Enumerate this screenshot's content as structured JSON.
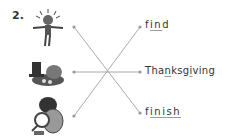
{
  "exercise": {
    "number": "2.",
    "instruction_type": "matching",
    "pictures": [
      {
        "name": "child-jumping-picture",
        "description": "child jumping with arms spread"
      },
      {
        "name": "turkey-dinner-picture",
        "description": "pilgrim hat and turkey dinner"
      },
      {
        "name": "detective-picture",
        "description": "detective with magnifying glass"
      }
    ],
    "words": [
      {
        "parts": [
          "f",
          "i",
          "n",
          "d"
        ],
        "underlined": [
          1,
          2
        ],
        "text": "find"
      },
      {
        "parts": [
          "Tha",
          "n",
          "ksg",
          "i",
          "ving"
        ],
        "underlined": [
          1,
          3
        ],
        "text": "Thanksgiving"
      },
      {
        "parts": [
          "f",
          "i",
          "n",
          "i",
          "s",
          "h"
        ],
        "underlined": [
          1,
          2,
          3,
          4,
          5
        ],
        "text": "finish"
      }
    ],
    "matches": [
      [
        0,
        2
      ],
      [
        1,
        1
      ],
      [
        2,
        0
      ]
    ],
    "line_color": "#aaaaaa"
  }
}
